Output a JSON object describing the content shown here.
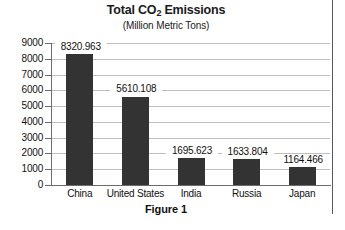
{
  "figure": {
    "caption": "Figure 1"
  },
  "chart_data": {
    "type": "bar",
    "title": "Total CO2 Emissions",
    "title_parts": {
      "before": "Total CO",
      "subscript": "2",
      "after": " Emissions"
    },
    "subtitle": "(Million Metric Tons)",
    "xlabel": "",
    "ylabel": "",
    "categories": [
      "China",
      "United States",
      "India",
      "Russia",
      "Japan"
    ],
    "values": [
      8320.963,
      5610.108,
      1695.623,
      1633.804,
      1164.466
    ],
    "value_labels": [
      "8320.963",
      "5610.108",
      "1695.623",
      "1633.804",
      "1164.466"
    ],
    "ylim": [
      0,
      9000
    ],
    "ytick_labels": [
      "9000",
      "8000",
      "7000",
      "6000",
      "5000",
      "4000",
      "3000",
      "2000",
      "1000",
      "0"
    ],
    "ytick_values": [
      9000,
      8000,
      7000,
      6000,
      5000,
      4000,
      3000,
      2000,
      1000,
      0
    ],
    "grid": true,
    "legend": false,
    "bar_color": "#333333",
    "gridline_color": "#bfbfbf",
    "axis_color": "#6b6b6b",
    "background_color": "#ffffff"
  }
}
